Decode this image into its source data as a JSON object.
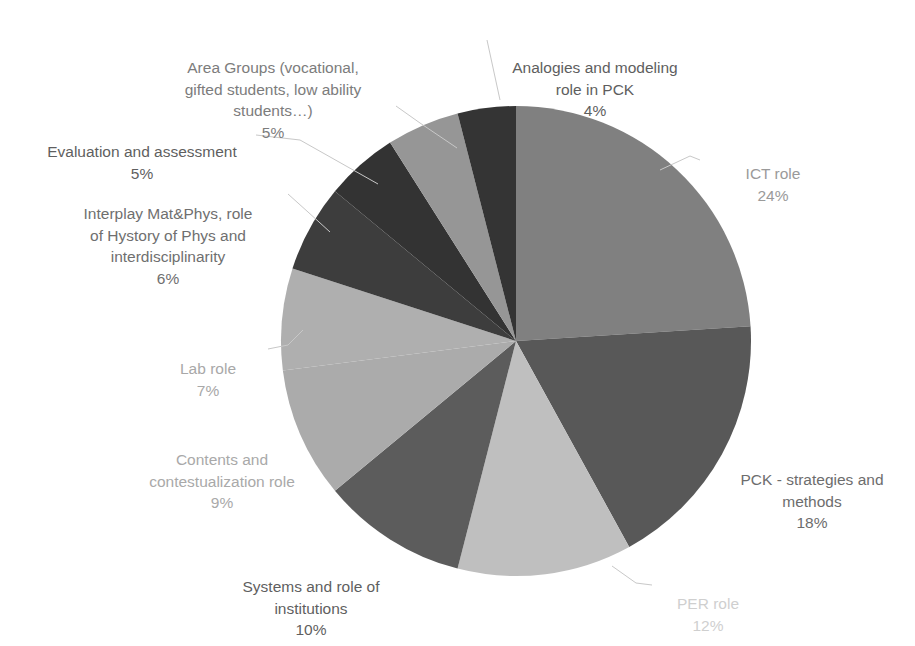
{
  "chart_data": {
    "type": "pie",
    "title": "",
    "legend_position": "none",
    "labels_show_percent": true,
    "start_angle_deg": 0,
    "direction": "clockwise",
    "categories": [
      "ICT role",
      "PCK - strategies and methods",
      "PER role",
      "Systems and role of institutions",
      "Contents and contestualization role",
      "Lab role",
      "Interplay Mat&Phys, role of Hystory of Phys and interdisciplinarity",
      "Evaluation and assessment",
      "Area Groups (vocational, gifted students, low ability students…)",
      "Analogies and modeling role in PCK"
    ],
    "values": [
      24,
      18,
      12,
      10,
      9,
      7,
      6,
      5,
      5,
      4
    ],
    "unit": "%",
    "colors": [
      "#808080",
      "#585858",
      "#bfbfbf",
      "#5c5c5c",
      "#ababab",
      "#afafaf",
      "#3d3d3d",
      "#333333",
      "#969696",
      "#343434"
    ],
    "slices": [
      {
        "name": "ICT role",
        "value": 24,
        "color": "#808080",
        "label_text": "ICT role",
        "percent_text": "24%"
      },
      {
        "name": "PCK - strategies and methods",
        "value": 18,
        "color": "#585858",
        "label_text": "PCK - strategies and\nmethods",
        "percent_text": "18%"
      },
      {
        "name": "PER role",
        "value": 12,
        "color": "#bfbfbf",
        "label_text": "PER role",
        "percent_text": "12%"
      },
      {
        "name": "Systems and role of institutions",
        "value": 10,
        "color": "#5c5c5c",
        "label_text": "Systems and role of\ninstitutions",
        "percent_text": "10%"
      },
      {
        "name": "Contents and contestualization role",
        "value": 9,
        "color": "#ababab",
        "label_text": "Contents and\ncontestualization role",
        "percent_text": "9%"
      },
      {
        "name": "Lab role",
        "value": 7,
        "color": "#afafaf",
        "label_text": "Lab role",
        "percent_text": "7%"
      },
      {
        "name": "Interplay Mat&Phys",
        "value": 6,
        "color": "#3d3d3d",
        "label_text": "Interplay Mat&Phys, role\nof Hystory of Phys and\ninterdisciplinarity",
        "percent_text": "6%"
      },
      {
        "name": "Evaluation and assessment",
        "value": 5,
        "color": "#333333",
        "label_text": "Evaluation and assessment",
        "percent_text": "5%"
      },
      {
        "name": "Area Groups",
        "value": 5,
        "color": "#969696",
        "label_text": "Area Groups (vocational,\ngifted students, low ability\nstudents…)",
        "percent_text": "5%"
      },
      {
        "name": "Analogies and modeling role in PCK",
        "value": 4,
        "color": "#343434",
        "label_text": "Analogies and modeling\nrole in PCK",
        "percent_text": "4%"
      }
    ]
  },
  "labels": {
    "analogies": {
      "text": "Analogies and modeling\nrole in PCK",
      "percent": "4%"
    },
    "area_groups": {
      "text": "Area Groups (vocational,\ngifted students, low ability\nstudents…)",
      "percent": "5%"
    },
    "evaluation": {
      "text": "Evaluation and assessment",
      "percent": "5%"
    },
    "interplay": {
      "text": "Interplay Mat&Phys, role\nof Hystory of Phys and\ninterdisciplinarity",
      "percent": "6%"
    },
    "lab": {
      "text": "Lab role",
      "percent": "7%"
    },
    "contents": {
      "text": "Contents and\ncontestualization role",
      "percent": "9%"
    },
    "systems": {
      "text": "Systems and role of\ninstitutions",
      "percent": "10%"
    },
    "per": {
      "text": "PER role",
      "percent": "12%"
    },
    "pck": {
      "text": "PCK - strategies and\nmethods",
      "percent": "18%"
    },
    "ict": {
      "text": "ICT role",
      "percent": "24%"
    }
  },
  "geometry": {
    "center_x": 516,
    "center_y": 341,
    "radius": 235
  }
}
